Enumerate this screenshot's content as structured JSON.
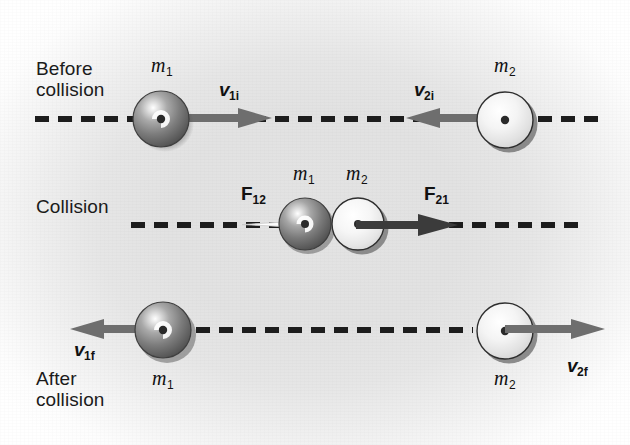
{
  "figure": {
    "background_color": "#e2e2e2",
    "ink_color": "#1d1d1d",
    "dash_color": "#1d1d1d"
  },
  "rows": [
    {
      "id": "before",
      "phase_label": "Before\ncollision",
      "masses": [
        {
          "name": "m1",
          "symbol": "m",
          "subscript": "1",
          "shade": "dark"
        },
        {
          "name": "m2",
          "symbol": "m",
          "subscript": "2",
          "shade": "light"
        }
      ],
      "vectors": [
        {
          "name": "v1i",
          "symbol": "v",
          "subscript": "1i",
          "direction": "right",
          "color": "#6b6b6b"
        },
        {
          "name": "v2i",
          "symbol": "v",
          "subscript": "2i",
          "direction": "left",
          "color": "#6b6b6b"
        }
      ]
    },
    {
      "id": "collision",
      "phase_label": "Collision",
      "masses": [
        {
          "name": "m1",
          "symbol": "m",
          "subscript": "1",
          "shade": "dark"
        },
        {
          "name": "m2",
          "symbol": "m",
          "subscript": "2",
          "shade": "light"
        }
      ],
      "vectors": [
        {
          "name": "F12",
          "symbol": "F",
          "subscript": "12",
          "direction": "left",
          "color": "#f2f2f2"
        },
        {
          "name": "F21",
          "symbol": "F",
          "subscript": "21",
          "direction": "right",
          "color": "#3a3a3a"
        }
      ]
    },
    {
      "id": "after",
      "phase_label": "After\ncollision",
      "masses": [
        {
          "name": "m1",
          "symbol": "m",
          "subscript": "1",
          "shade": "dark"
        },
        {
          "name": "m2",
          "symbol": "m",
          "subscript": "2",
          "shade": "light"
        }
      ],
      "vectors": [
        {
          "name": "v1f",
          "symbol": "v",
          "subscript": "1f",
          "direction": "left",
          "color": "#6b6b6b"
        },
        {
          "name": "v2f",
          "symbol": "v",
          "subscript": "2f",
          "direction": "right",
          "color": "#6b6b6b"
        }
      ]
    }
  ],
  "labels": {
    "before_collision": "Before\ncollision",
    "collision": "Collision",
    "after_collision": "After\ncollision",
    "m1_row1": "m",
    "m1_row1_sub": "1",
    "m2_row1": "m",
    "m2_row1_sub": "2",
    "m1_row2": "m",
    "m1_row2_sub": "1",
    "m2_row2": "m",
    "m2_row2_sub": "2",
    "m1_row3": "m",
    "m1_row3_sub": "1",
    "m2_row3": "m",
    "m2_row3_sub": "2",
    "v1i": "v",
    "v1i_sub": "1i",
    "v2i": "v",
    "v2i_sub": "2i",
    "F12": "F",
    "F12_sub": "12",
    "F21": "F",
    "F21_sub": "21",
    "v1f": "v",
    "v1f_sub": "1f",
    "v2f": "v",
    "v2f_sub": "2f"
  }
}
